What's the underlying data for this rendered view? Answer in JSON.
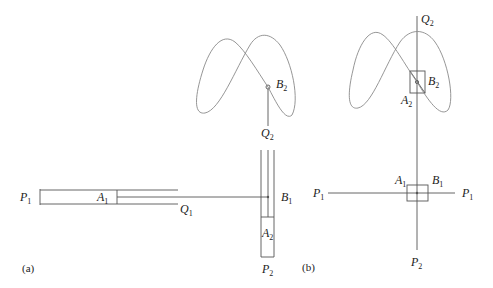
{
  "figure": {
    "panels": [
      {
        "id": "a",
        "caption": "(a)",
        "labels": {
          "P1": {
            "base": "P",
            "sub": "1"
          },
          "A1": {
            "base": "A",
            "sub": "1"
          },
          "Q1": {
            "base": "Q",
            "sub": "1"
          },
          "B1": {
            "base": "B",
            "sub": "1"
          },
          "A2": {
            "base": "A",
            "sub": "2"
          },
          "P2": {
            "base": "P",
            "sub": "2"
          },
          "Q2": {
            "base": "Q",
            "sub": "2"
          },
          "B2": {
            "base": "B",
            "sub": "2"
          }
        }
      },
      {
        "id": "b",
        "caption": "(b)",
        "labels": {
          "Q2": {
            "base": "Q",
            "sub": "2"
          },
          "B2": {
            "base": "B",
            "sub": "2"
          },
          "A2": {
            "base": "A",
            "sub": "2"
          },
          "A1": {
            "base": "A",
            "sub": "1"
          },
          "B1": {
            "base": "B",
            "sub": "1"
          },
          "P1_left": {
            "base": "P",
            "sub": "1"
          },
          "P1_right": {
            "base": "P",
            "sub": "1"
          },
          "P2": {
            "base": "P",
            "sub": "2"
          }
        }
      }
    ]
  }
}
